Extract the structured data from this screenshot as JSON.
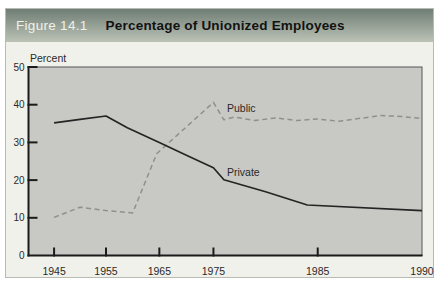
{
  "header": {
    "figure_label": "Figure 14.1",
    "title": "Percentage of Unionized Employees"
  },
  "colors": {
    "page_bg": "#ffffff",
    "figure_bg": "#f1f1eb",
    "figure_border": "#b8bbb1",
    "header_gradient_top": "#6f7d74",
    "header_gradient_bottom": "#bcc3b6",
    "header_label": "#eef2ea",
    "header_title": "#121212",
    "plot_bg": "#c8c9c4",
    "plot_border": "#56575a",
    "axis": "#1b1b1b",
    "text": "#2a2a2a"
  },
  "chart_data": {
    "type": "line",
    "title": "Percentage of Unionized Employees",
    "ylabel": "Percent",
    "xlabel": "",
    "ylim": [
      0,
      50
    ],
    "y_ticks": [
      0,
      10,
      20,
      30,
      40,
      50
    ],
    "grid": false,
    "legend_position": "inline-labels",
    "x_ticks": [
      {
        "label": "1945",
        "year": 1945,
        "frac": 0.065,
        "tick": true
      },
      {
        "label": "1955",
        "year": 1955,
        "frac": 0.197,
        "tick": true
      },
      {
        "label": "1965",
        "year": 1965,
        "frac": 0.3325,
        "tick": true
      },
      {
        "label": "1975",
        "year": 1975,
        "frac": 0.47,
        "tick": true
      },
      {
        "label": "1985",
        "year": 1985,
        "frac": 0.735,
        "tick": true
      },
      {
        "label": "1990",
        "year": 1990,
        "frac": 1.0,
        "tick": false
      }
    ],
    "series": [
      {
        "name": "Public",
        "label": "Public",
        "style": "dashed",
        "color": "#8f908b",
        "label_anchor": {
          "year": 1976.3,
          "value": 38.1
        },
        "points": [
          [
            1945,
            10.1
          ],
          [
            1950,
            12.8
          ],
          [
            1955,
            11.9
          ],
          [
            1960,
            11.3
          ],
          [
            1964.5,
            27.0
          ],
          [
            1975,
            40.6
          ],
          [
            1976,
            36.0
          ],
          [
            1977,
            36.7
          ],
          [
            1979,
            35.8
          ],
          [
            1981,
            36.5
          ],
          [
            1983,
            35.8
          ],
          [
            1985,
            36.2
          ],
          [
            1986,
            35.6
          ],
          [
            1988,
            37.1
          ],
          [
            1989,
            36.9
          ],
          [
            1990,
            36.3
          ]
        ]
      },
      {
        "name": "Private",
        "label": "Private",
        "style": "solid",
        "color": "#242424",
        "label_anchor": {
          "year": 1976.3,
          "value": 21.0
        },
        "points": [
          [
            1945,
            35.2
          ],
          [
            1950,
            36.1
          ],
          [
            1955,
            37.0
          ],
          [
            1959,
            33.9
          ],
          [
            1965,
            30.0
          ],
          [
            1970,
            26.6
          ],
          [
            1975,
            23.3
          ],
          [
            1976,
            20.1
          ],
          [
            1980,
            16.9
          ],
          [
            1984,
            13.4
          ],
          [
            1990,
            11.9
          ]
        ]
      }
    ]
  }
}
